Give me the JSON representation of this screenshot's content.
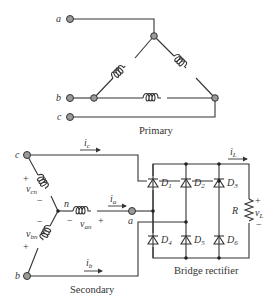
{
  "primary": {
    "caption": "Primary",
    "terminals": [
      "a",
      "b",
      "c"
    ],
    "winding_connection": "delta"
  },
  "secondary": {
    "caption": "Secondary",
    "terminals": [
      "c",
      "b",
      "a"
    ],
    "neutral_label": "n",
    "winding_connection": "wye",
    "voltages": {
      "vcn": {
        "main": "v",
        "sub": "cn"
      },
      "vbn": {
        "main": "v",
        "sub": "bn"
      },
      "van": {
        "main": "v",
        "sub": "an"
      }
    },
    "currents": {
      "ic": {
        "main": "i",
        "sub": "c"
      },
      "ia": {
        "main": "i",
        "sub": "a"
      },
      "ib": {
        "main": "i",
        "sub": "b"
      }
    },
    "plus": "+",
    "minus": "−"
  },
  "rectifier": {
    "caption": "Bridge rectifier",
    "diodes": [
      {
        "main": "D",
        "sub": "1"
      },
      {
        "main": "D",
        "sub": "2"
      },
      {
        "main": "D",
        "sub": "3"
      },
      {
        "main": "D",
        "sub": "4"
      },
      {
        "main": "D",
        "sub": "5"
      },
      {
        "main": "D",
        "sub": "6"
      }
    ],
    "load": {
      "resistor": "R",
      "current": {
        "main": "i",
        "sub": "L"
      },
      "voltage": {
        "main": "v",
        "sub": "L"
      },
      "plus": "+",
      "minus": "−"
    }
  }
}
